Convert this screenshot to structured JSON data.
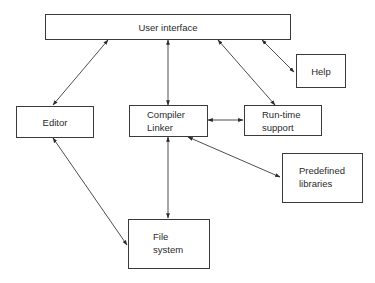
{
  "diagram": {
    "type": "block-diagram",
    "nodes": {
      "user_interface": {
        "label": "User interface"
      },
      "help": {
        "label": "Help"
      },
      "editor": {
        "label": "Editor"
      },
      "compiler_linker": {
        "line1": "Compiler",
        "line2": "Linker"
      },
      "runtime_support": {
        "line1": "Run-time",
        "line2": "support"
      },
      "predefined_libraries": {
        "line1": "Predefined",
        "line2": "libraries"
      },
      "file_system": {
        "line1": "File",
        "line2": "system"
      }
    },
    "edges": [
      {
        "from": "User interface",
        "to": "Editor",
        "direction": "bidirectional"
      },
      {
        "from": "User interface",
        "to": "Compiler Linker",
        "direction": "bidirectional"
      },
      {
        "from": "User interface",
        "to": "Run-time support",
        "direction": "bidirectional"
      },
      {
        "from": "User interface",
        "to": "Help",
        "direction": "bidirectional"
      },
      {
        "from": "Compiler Linker",
        "to": "Run-time support",
        "direction": "bidirectional"
      },
      {
        "from": "Compiler Linker",
        "to": "Predefined libraries",
        "direction": "bidirectional"
      },
      {
        "from": "Compiler Linker",
        "to": "File system",
        "direction": "bidirectional"
      },
      {
        "from": "Editor",
        "to": "File system",
        "direction": "bidirectional"
      }
    ],
    "colors": {
      "stroke": "#3a3a3a",
      "background": "#ffffff",
      "text": "#2a2a2a"
    }
  }
}
